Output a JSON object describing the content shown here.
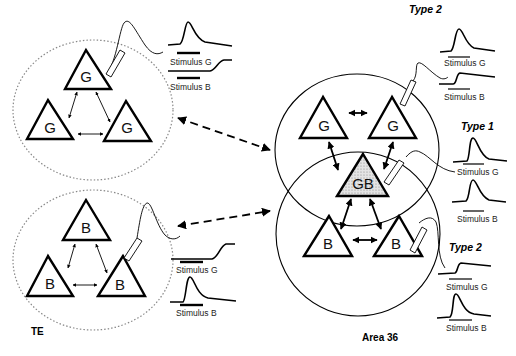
{
  "figure": {
    "regions": [
      {
        "id": "te",
        "label": "TE"
      },
      {
        "id": "area36",
        "label": "Area 36"
      }
    ],
    "te_top_cluster": {
      "neurons": [
        "G",
        "G",
        "G"
      ],
      "recording": {
        "traces": [
          {
            "stimulus": "Stimulus G",
            "response": "strong"
          },
          {
            "stimulus": "Stimulus B",
            "response": "weak-late"
          }
        ]
      }
    },
    "te_bottom_cluster": {
      "neurons": [
        "B",
        "B",
        "B"
      ],
      "recording": {
        "traces": [
          {
            "stimulus": "Stimulus G",
            "response": "weak-late"
          },
          {
            "stimulus": "Stimulus B",
            "response": "strong"
          }
        ]
      }
    },
    "area36_top_cluster": {
      "neurons": [
        "G",
        "G"
      ],
      "type_label": "Type 2",
      "traces": [
        {
          "stimulus": "Stimulus G",
          "response": "strong"
        },
        {
          "stimulus": "Stimulus B",
          "response": "weak"
        }
      ]
    },
    "area36_overlap": {
      "neuron": "GB",
      "type_label": "Type 1",
      "traces": [
        {
          "stimulus": "Stimulus G",
          "response": "strong"
        },
        {
          "stimulus": "Stimulus B",
          "response": "strong"
        }
      ]
    },
    "area36_bottom_cluster": {
      "neurons": [
        "B",
        "B"
      ],
      "type_label": "Type 2",
      "traces": [
        {
          "stimulus": "Stimulus G",
          "response": "weak"
        },
        {
          "stimulus": "Stimulus B",
          "response": "strong"
        }
      ]
    },
    "labels": {
      "G": "G",
      "B": "B",
      "GB": "GB",
      "stim_g": "Stimulus G",
      "stim_b": "Stimulus B",
      "type1": "Type 1",
      "type2": "Type 2",
      "te": "TE",
      "area36": "Area 36"
    }
  }
}
